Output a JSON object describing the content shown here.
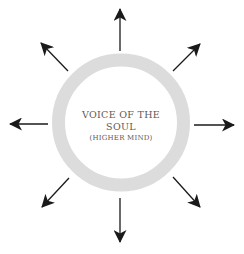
{
  "diagram": {
    "center": {
      "title_line1": "VOICE OF THE",
      "title_line2": "SOUL",
      "subtitle": "(HIGHER MIND)"
    },
    "ring": {
      "color": "#dcdcdc",
      "cx": 121,
      "cy": 122.5,
      "outer_radius": 69,
      "thickness": 13
    },
    "arrows": [
      {
        "direction": "up"
      },
      {
        "direction": "up-right"
      },
      {
        "direction": "right"
      },
      {
        "direction": "down-right"
      },
      {
        "direction": "down"
      },
      {
        "direction": "down-left"
      },
      {
        "direction": "left"
      },
      {
        "direction": "up-left"
      }
    ],
    "arrow_color": "#1a1a1a"
  }
}
